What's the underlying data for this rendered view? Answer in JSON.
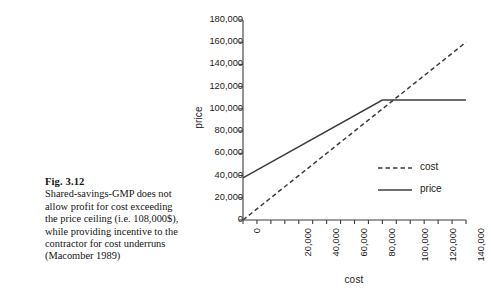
{
  "caption": {
    "figure_label": "Fig. 3.12",
    "body": "Shared-savings-GMP does not allow profit for cost exceeding the price ceiling (i.e. 108,000$), while providing incentive to the contractor for cost underruns (Macomber 1989)"
  },
  "chart_data": {
    "type": "line",
    "title": "",
    "xlabel": "cost",
    "ylabel": "price",
    "xlim": [
      0,
      160000
    ],
    "ylim": [
      0,
      180000
    ],
    "xticks": [
      0,
      20000,
      40000,
      60000,
      80000,
      100000,
      120000,
      140000,
      160000
    ],
    "yticks": [
      0,
      20000,
      40000,
      60000,
      80000,
      100000,
      120000,
      140000,
      160000,
      180000
    ],
    "xticklabels": [
      "0",
      "20,000",
      "40,000",
      "60,000",
      "80,000",
      "100,000",
      "120,000",
      "140,000",
      "160,000"
    ],
    "yticklabels": [
      "0",
      "20,000",
      "40,000",
      "60,000",
      "80,000",
      "100,000",
      "120,000",
      "140,000",
      "160,000",
      "180,000"
    ],
    "grid": false,
    "legend_position": "lower right",
    "series": [
      {
        "name": "cost",
        "style": "dashed",
        "color": "#3c3c3c",
        "x": [
          0,
          160000
        ],
        "y": [
          0,
          160000
        ]
      },
      {
        "name": "price",
        "style": "solid",
        "color": "#3c3c3c",
        "x": [
          0,
          100000,
          160000
        ],
        "y": [
          38000,
          108000,
          108000
        ]
      }
    ],
    "annotations": {
      "price_ceiling": 108000,
      "breakpoint_cost": 100000,
      "price_intercept": 38000
    }
  },
  "legend": {
    "items": [
      {
        "label": "cost",
        "style": "dashed"
      },
      {
        "label": "price",
        "style": "solid"
      }
    ]
  },
  "colors": {
    "line": "#3c3c3c",
    "axis": "#3c3c3c",
    "text": "#1a1a1a",
    "background": "#ffffff"
  }
}
